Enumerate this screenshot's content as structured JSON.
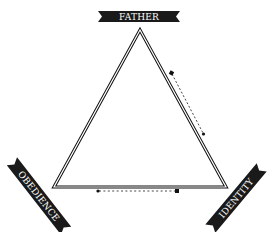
{
  "diagram": {
    "type": "triangle-relationship",
    "colors": {
      "line": "#111111",
      "banner": "#1a1a1a",
      "banner_text": "#ffffff",
      "background": "#ffffff"
    },
    "nodes": {
      "top": {
        "label": "FATHER"
      },
      "bottom_left": {
        "label": "OBEDIENCE"
      },
      "bottom_right": {
        "label": "IDENTITY"
      }
    },
    "arrows": [
      {
        "from": "top",
        "to": "bottom_right",
        "style": "dashed",
        "side": "right"
      },
      {
        "from": "bottom_right",
        "to": "bottom_left",
        "style": "dashed",
        "side": "bottom"
      }
    ]
  }
}
